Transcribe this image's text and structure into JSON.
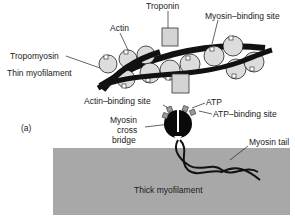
{
  "figure": {
    "panel_label": "(a)",
    "labels": {
      "troponin": "Troponin",
      "actin": "Actin",
      "myosin_binding_site": "Myosin–binding site",
      "tropomyosin": "Tropomyosin",
      "thin_myofilament": "Thin myofilament",
      "actin_binding_site": "Actin–binding site",
      "atp": "ATP",
      "atp_binding_site": "ATP–binding site",
      "myosin_cross_bridge_1": "Myosin",
      "myosin_cross_bridge_2": "cross",
      "myosin_cross_bridge_3": "bridge",
      "myosin_tail": "Myosin tail",
      "thick_myofilament": "Thick myofilament"
    },
    "colors": {
      "thick_filament": "#a8a8a8",
      "actin_globule": "#dcdcdc",
      "troponin": "#d4d4d4",
      "strand": "#111111",
      "myosin_head": "#0a0a0a",
      "atp": "#9a9a9a"
    }
  }
}
